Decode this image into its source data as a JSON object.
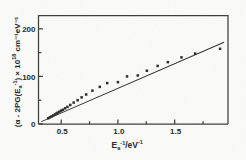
{
  "chart_data": {
    "type": "scatter",
    "title": "",
    "xlabel": "E⁻¹/eV⁻¹",
    "xlabel_parts": {
      "base": "E",
      "sub": "a",
      "sup1": "-1",
      "mid": "/eV",
      "sup2": "-1"
    },
    "ylabel": "(α − 2PG(E⁻¹)) × 10¹⁸ cm⁻¹ eV⁻¹",
    "ylabel_parts": {
      "open": "(α - 2PG(E",
      "ysub": "a",
      "ysup": "-1",
      "close": ")",
      "times": " × 10",
      "exp": "18",
      "units": " cm⁻¹eV⁻¹"
    },
    "xlim": [
      0.3,
      1.97
    ],
    "ylim": [
      0,
      228
    ],
    "xticks": [
      0.5,
      1.0,
      1.5
    ],
    "xticklabels": [
      "0.5",
      "1.0",
      "1.5"
    ],
    "xminorticks": [
      0.75,
      1.25,
      1.75
    ],
    "yticks": [
      0,
      100,
      200
    ],
    "yticklabels": [
      "0",
      "100",
      "200"
    ],
    "yminorticks": [
      50,
      150
    ],
    "grid": false,
    "legend": null,
    "marker": "filled-square",
    "series": [
      {
        "name": "data",
        "points": [
          [
            0.385,
            12
          ],
          [
            0.4,
            14
          ],
          [
            0.415,
            16
          ],
          [
            0.43,
            18
          ],
          [
            0.445,
            20
          ],
          [
            0.458,
            22
          ],
          [
            0.47,
            24
          ],
          [
            0.485,
            26
          ],
          [
            0.5,
            28
          ],
          [
            0.515,
            30
          ],
          [
            0.535,
            33
          ],
          [
            0.555,
            36
          ],
          [
            0.58,
            40
          ],
          [
            0.61,
            45
          ],
          [
            0.645,
            50
          ],
          [
            0.68,
            56
          ],
          [
            0.72,
            62
          ],
          [
            0.775,
            70
          ],
          [
            0.84,
            78
          ],
          [
            0.905,
            86
          ],
          [
            1.0,
            88
          ],
          [
            1.08,
            100
          ],
          [
            1.175,
            102
          ],
          [
            1.255,
            112
          ],
          [
            1.35,
            122
          ],
          [
            1.44,
            130
          ],
          [
            1.56,
            140
          ],
          [
            1.68,
            148
          ],
          [
            1.9,
            158
          ]
        ]
      }
    ],
    "fitline": {
      "name": "linear fit",
      "x0": 0.325,
      "y0": 5,
      "x1": 1.935,
      "y1": 172
    }
  },
  "colors": {
    "background": "#fbfbfa",
    "axis": "#3c3c3c",
    "marker": "#2a2a2a",
    "line": "#303030",
    "text": "#262626"
  }
}
